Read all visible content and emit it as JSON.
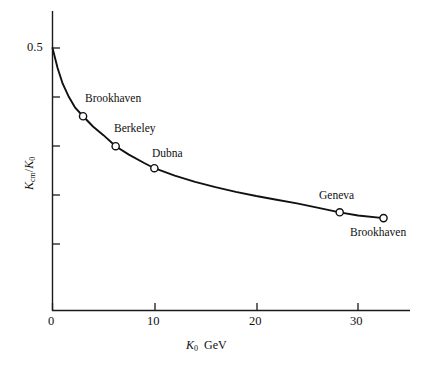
{
  "chart_data": {
    "type": "line",
    "title": "",
    "subtitle": "",
    "xlabel": "K0 GeV",
    "ylabel": "Kcm/K0",
    "xlabel_parts": {
      "symbol": "K",
      "subscript": "0",
      "units": "GeV"
    },
    "ylabel_parts": {
      "numerator_symbol": "K",
      "numerator_subscript": "cm",
      "denominator_symbol": "K",
      "denominator_subscript": "0"
    },
    "xlim": [
      0,
      35.1
    ],
    "ylim": [
      0,
      0.5
    ],
    "xticks": [
      0,
      10,
      20,
      30
    ],
    "xtick_labels": [
      "0",
      "10",
      "20",
      "30"
    ],
    "yticks": [
      0.1,
      0.2,
      0.3,
      0.4,
      0.5
    ],
    "ytick_labels": [
      "",
      "",
      "",
      "",
      "0.5"
    ],
    "grid": false,
    "legend": false,
    "line_color": "#111111",
    "marker_face_color": "#ffffff",
    "marker_edge_color": "#111111",
    "curve": {
      "x": [
        0.0,
        0.5,
        1.0,
        1.6,
        2.2,
        3.0,
        4.0,
        5.0,
        6.2,
        7.5,
        9.0,
        10.0,
        12.0,
        14.0,
        16.0,
        18.0,
        20.0,
        22.0,
        24.0,
        26.0,
        28.2,
        30.0,
        32.5
      ],
      "y": [
        0.5,
        0.462,
        0.432,
        0.407,
        0.387,
        0.37,
        0.35,
        0.334,
        0.313,
        0.297,
        0.281,
        0.271,
        0.257,
        0.245,
        0.235,
        0.226,
        0.218,
        0.211,
        0.204,
        0.196,
        0.187,
        0.181,
        0.176
      ]
    },
    "points": [
      {
        "label": "Brookhaven",
        "x": 3.0,
        "y": 0.37,
        "label_position": "above-right"
      },
      {
        "label": "Berkeley",
        "x": 6.2,
        "y": 0.313,
        "label_position": "above-right"
      },
      {
        "label": "Dubna",
        "x": 10.0,
        "y": 0.271,
        "label_position": "above-right"
      },
      {
        "label": "Geneva",
        "x": 28.2,
        "y": 0.187,
        "label_position": "above-left"
      },
      {
        "label": "Brookhaven",
        "x": 32.5,
        "y": 0.176,
        "label_position": "below-left"
      }
    ]
  },
  "axes": {
    "x_tick_0": "0",
    "x_tick_10": "10",
    "x_tick_20": "20",
    "x_tick_30": "30",
    "y_tick_half": "0.5"
  },
  "annotations": {
    "brookhaven_low": "Brookhaven",
    "berkeley": "Berkeley",
    "dubna": "Dubna",
    "geneva": "Geneva",
    "brookhaven_high": "Brookhaven"
  }
}
